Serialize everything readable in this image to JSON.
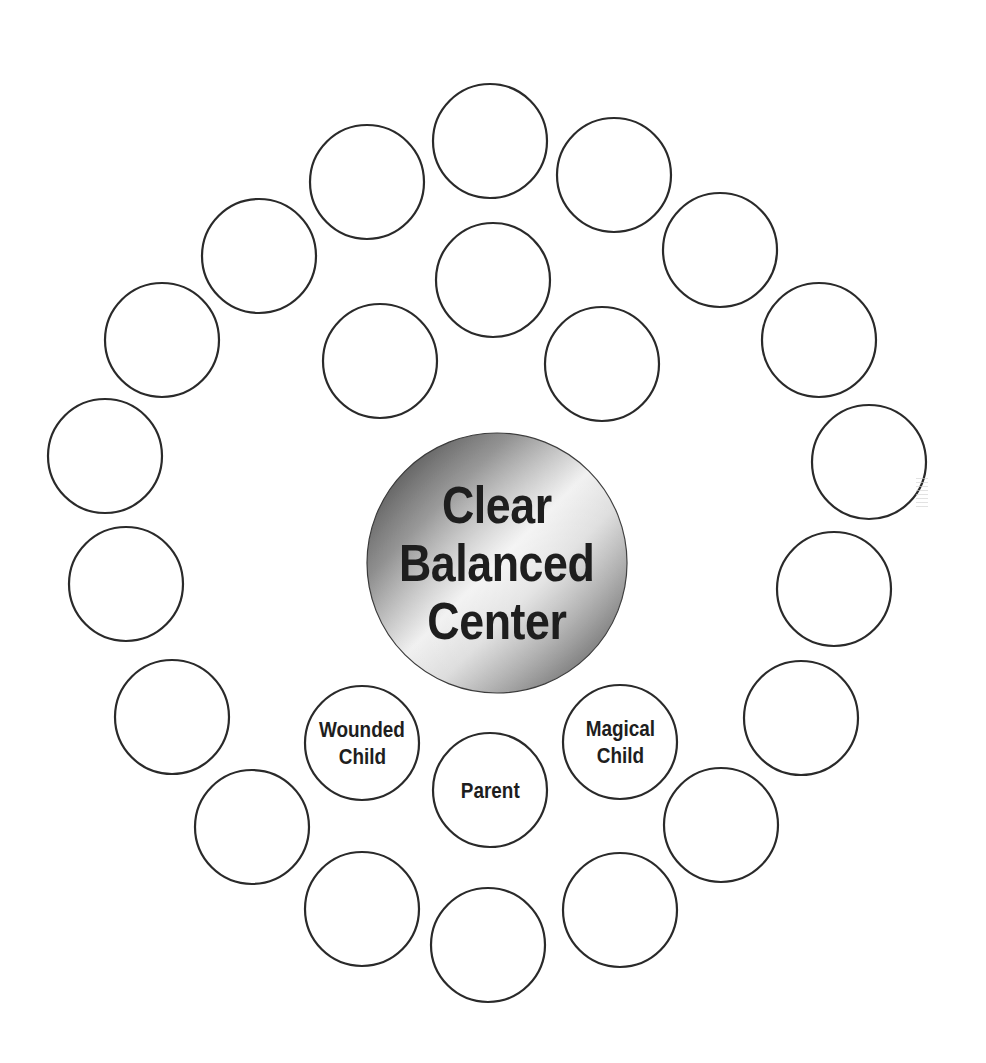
{
  "diagram": {
    "center": {
      "lines": [
        "Clear",
        "Balanced",
        "Center"
      ],
      "cx": 497,
      "cy": 563,
      "r": 130
    },
    "labeled_nodes": [
      {
        "id": "wounded-child",
        "lines": [
          "Wounded",
          "Child"
        ],
        "cx": 362,
        "cy": 743
      },
      {
        "id": "parent",
        "lines": [
          "Parent"
        ],
        "cx": 490,
        "cy": 790
      },
      {
        "id": "magical-child",
        "lines": [
          "Magical",
          "Child"
        ],
        "cx": 620,
        "cy": 742
      }
    ],
    "inner_empty_nodes": [
      {
        "cx": 493,
        "cy": 280
      },
      {
        "cx": 380,
        "cy": 361
      },
      {
        "cx": 602,
        "cy": 364
      }
    ],
    "outer_ring_nodes": [
      {
        "cx": 490,
        "cy": 141
      },
      {
        "cx": 614,
        "cy": 175
      },
      {
        "cx": 720,
        "cy": 250
      },
      {
        "cx": 819,
        "cy": 340
      },
      {
        "cx": 869,
        "cy": 462
      },
      {
        "cx": 834,
        "cy": 589
      },
      {
        "cx": 801,
        "cy": 718
      },
      {
        "cx": 721,
        "cy": 825
      },
      {
        "cx": 620,
        "cy": 910
      },
      {
        "cx": 488,
        "cy": 945
      },
      {
        "cx": 362,
        "cy": 909
      },
      {
        "cx": 252,
        "cy": 827
      },
      {
        "cx": 172,
        "cy": 717
      },
      {
        "cx": 126,
        "cy": 584
      },
      {
        "cx": 105,
        "cy": 456
      },
      {
        "cx": 162,
        "cy": 340
      },
      {
        "cx": 259,
        "cy": 256
      },
      {
        "cx": 367,
        "cy": 182
      }
    ],
    "node_radius": 57,
    "colors": {
      "stroke": "#2a2a2a",
      "text": "#1e1e1e",
      "fill": "#ffffff"
    }
  }
}
